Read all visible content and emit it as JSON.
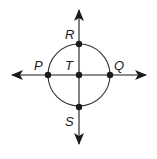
{
  "diagram": {
    "type": "geometry",
    "colors": {
      "stroke": "#1a1a1a",
      "circle": "#333333",
      "background": "#ffffff"
    },
    "center": {
      "x": 79,
      "y": 75
    },
    "radius": 31,
    "points": [
      {
        "id": "R",
        "label": "R",
        "x": 79,
        "y": 44,
        "label_x": 65,
        "label_y": 39
      },
      {
        "id": "P",
        "label": "P",
        "x": 48,
        "y": 75,
        "label_x": 34,
        "label_y": 70
      },
      {
        "id": "T",
        "label": "T",
        "x": 79,
        "y": 75,
        "label_x": 65,
        "label_y": 70
      },
      {
        "id": "Q",
        "label": "Q",
        "x": 110,
        "y": 75,
        "label_x": 114,
        "label_y": 70
      },
      {
        "id": "S",
        "label": "S",
        "x": 79,
        "y": 107,
        "label_x": 65,
        "label_y": 126
      }
    ],
    "lines": [
      {
        "id": "line-PQ",
        "label": "PQ",
        "orientation": "horizontal",
        "x1": 12,
        "y1": 75,
        "x2": 146,
        "y2": 75,
        "arrows": "both"
      },
      {
        "id": "line-RS",
        "label": "RS",
        "orientation": "vertical",
        "x1": 79,
        "y1": 10,
        "x2": 79,
        "y2": 144,
        "arrows": "both"
      }
    ]
  }
}
